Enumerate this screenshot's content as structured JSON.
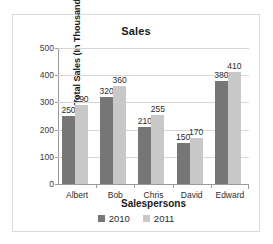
{
  "chart_data": {
    "type": "bar",
    "title": "Sales",
    "xlabel": "Salespersons",
    "ylabel": "Total Sales (In Thousands)",
    "categories": [
      "Albert",
      "Bob",
      "Chris",
      "David",
      "Edward"
    ],
    "series": [
      {
        "name": "2010",
        "color": "#767676",
        "values": [
          250,
          320,
          210,
          150,
          380
        ]
      },
      {
        "name": "2011",
        "color": "#c8c8c8",
        "values": [
          290,
          360,
          255,
          170,
          410
        ]
      }
    ],
    "ylim": [
      0,
      500
    ],
    "yticks": [
      0,
      100,
      200,
      300,
      400,
      500
    ],
    "ytick_labels": [
      "0",
      "100",
      "200",
      "300",
      "400",
      "500"
    ],
    "grid": true,
    "data_labels": true,
    "legend_position": "bottom"
  }
}
